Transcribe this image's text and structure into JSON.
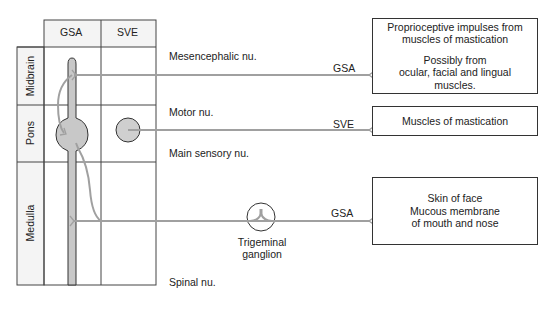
{
  "table": {
    "column_headers": [
      "GSA",
      "SVE"
    ],
    "row_labels": [
      "Midbrain",
      "Pons",
      "Medulla"
    ]
  },
  "nuclei": {
    "mesencephalic": "Mesencephalic nu.",
    "motor": "Motor nu.",
    "main_sensory": "Main sensory nu.",
    "spinal": "Spinal nu."
  },
  "pathways": [
    {
      "label": "GSA",
      "target": "box1"
    },
    {
      "label": "SVE",
      "target": "box2"
    },
    {
      "label": "GSA",
      "target": "box3"
    }
  ],
  "ganglion": {
    "label_line1": "Trigeminal",
    "label_line2": "ganglion"
  },
  "boxes": {
    "box1": {
      "line1": "Proprioceptive impulses from",
      "line2": "muscles of mastication",
      "line3": "Possibly from",
      "line4": "ocular, facial and lingual",
      "line5": "muscles."
    },
    "box2": {
      "line1": "Muscles of mastication"
    },
    "box3": {
      "line1": "Skin of face",
      "line2": "Mucous membrane",
      "line3": "of mouth and nose"
    }
  },
  "colors": {
    "line": "#333333",
    "fiber": "#a8a8a8",
    "nucleus_fill": "#cfcfcf",
    "label_column_fill": "#f2f2f2"
  }
}
